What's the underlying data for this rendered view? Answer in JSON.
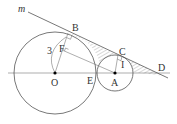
{
  "diagram": {
    "type": "geometry",
    "labels": {
      "m": "m",
      "B": "B",
      "C": "C",
      "D": "D",
      "E": "E",
      "F": "F",
      "I": "I",
      "O": "O",
      "A": "A",
      "radius": "3"
    },
    "points": {
      "O": [
        55,
        73
      ],
      "A": [
        115,
        73
      ],
      "B": [
        68,
        33
      ],
      "C": [
        118,
        55
      ],
      "D": [
        165,
        76
      ],
      "E": [
        96,
        73
      ]
    },
    "circles": [
      {
        "name": "circle-O",
        "center": "O",
        "r": 41
      },
      {
        "name": "circle-A",
        "center": "A",
        "r": 18
      }
    ],
    "colors": {
      "line": "#555555",
      "hatch": "#888888",
      "point": "#000000"
    }
  }
}
